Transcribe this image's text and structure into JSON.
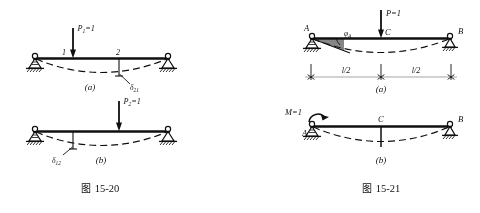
{
  "page": {
    "background_color": "#ffffff",
    "ink_color": "#111111",
    "figures": 2
  },
  "figure_left": {
    "caption": "图 15-20",
    "caption_cn": "图",
    "caption_num": "15-20",
    "panels": [
      {
        "id": "a",
        "panel_label": "(a)",
        "load_label": "P₁=1",
        "load_label_base": "P",
        "load_label_sub": "1",
        "load_label_eq": "=1",
        "point_labels": [
          "1",
          "2"
        ],
        "deflection_label": "δ₂₁",
        "deflection_base": "δ",
        "deflection_sub": "21",
        "supports": [
          "pin",
          "pin"
        ],
        "load_position": "point-1",
        "measured_at": "point-2"
      },
      {
        "id": "b",
        "panel_label": "(b)",
        "load_label": "P₂=1",
        "load_label_base": "P",
        "load_label_sub": "2",
        "load_label_eq": "=1",
        "point_labels": [],
        "deflection_label": "δ₁₂",
        "deflection_base": "δ",
        "deflection_sub": "12",
        "supports": [
          "pin",
          "pin"
        ],
        "load_position": "point-2",
        "measured_at": "point-1"
      }
    ]
  },
  "figure_right": {
    "caption": "图 15-21",
    "caption_cn": "图",
    "caption_num": "15-21",
    "panels": [
      {
        "id": "a",
        "panel_label": "(a)",
        "load_label": "P=1",
        "node_labels": [
          "A",
          "C",
          "B"
        ],
        "angle_label": "φ_A",
        "angle_base": "φ",
        "angle_sub": "A",
        "dimensions": [
          "l/2",
          "l/2"
        ],
        "dimension_left": "l/2",
        "dimension_right": "l/2",
        "supports": [
          "pin",
          "roller"
        ]
      },
      {
        "id": "b",
        "panel_label": "(b)",
        "load_label": "M=1",
        "node_labels": [
          "A",
          "C",
          "B"
        ],
        "supports": [
          "pin",
          "roller"
        ],
        "load_type": "moment"
      }
    ]
  }
}
